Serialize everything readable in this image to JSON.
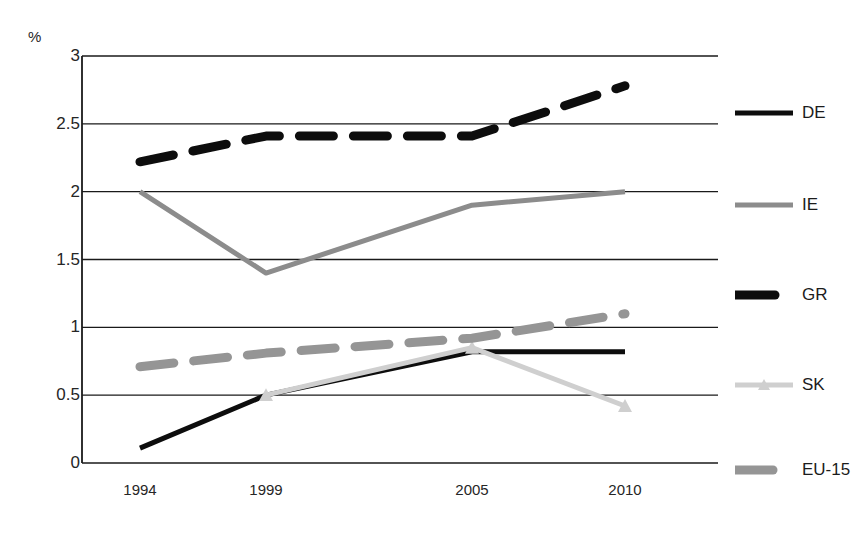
{
  "chart_data": {
    "type": "line",
    "title": "",
    "subtitle": "",
    "xlabel": "",
    "ylabel": "%",
    "unit_label": "%",
    "categories": [
      "1994",
      "1999",
      "2005",
      "2010"
    ],
    "x_tick_labels": [
      "1994",
      "1999",
      "2005",
      "2010"
    ],
    "y_tick_labels": [
      "0",
      "0.5",
      "1",
      "1.5",
      "2",
      "2.5",
      "3"
    ],
    "y_tick_values": [
      0,
      0.5,
      1,
      1.5,
      2,
      2.5,
      3
    ],
    "ylim": [
      0,
      3
    ],
    "grid": "horizontal",
    "legend_position": "right",
    "series": [
      {
        "name": "DE",
        "label": "DE",
        "color": "#0d0d0d",
        "style": "solid",
        "width": 5,
        "marker": "none",
        "x": [
          "1994",
          "1999",
          "2005",
          "2010"
        ],
        "values": [
          0.11,
          0.5,
          0.82,
          0.82
        ]
      },
      {
        "name": "IE",
        "label": "IE",
        "color": "#8c8c8c",
        "style": "solid",
        "width": 5,
        "marker": "none",
        "x": [
          "1994",
          "1999",
          "2005",
          "2010"
        ],
        "values": [
          2.0,
          1.4,
          1.9,
          2.0
        ]
      },
      {
        "name": "GR",
        "label": "GR",
        "color": "#0d0d0d",
        "style": "dashed",
        "width": 9,
        "marker": "none",
        "x": [
          "1994",
          "1999",
          "2005",
          "2010"
        ],
        "values": [
          2.22,
          2.41,
          2.41,
          2.78
        ]
      },
      {
        "name": "SK",
        "label": "SK",
        "color": "#cfcfcf",
        "style": "solid",
        "width": 5,
        "marker": "triangle",
        "x": [
          "1994",
          "1999",
          "2005",
          "2010"
        ],
        "values": [
          null,
          0.5,
          0.85,
          0.42
        ]
      },
      {
        "name": "EU-15",
        "label": "EU-15",
        "color": "#959595",
        "style": "dashed",
        "width": 9,
        "marker": "none",
        "x": [
          "1994",
          "1999",
          "2005",
          "2010"
        ],
        "values": [
          0.71,
          0.81,
          0.92,
          1.1
        ]
      }
    ],
    "annotations": []
  },
  "legend": {
    "items": [
      {
        "label": "DE"
      },
      {
        "label": "IE"
      },
      {
        "label": "GR"
      },
      {
        "label": "SK"
      },
      {
        "label": "EU-15"
      }
    ]
  }
}
